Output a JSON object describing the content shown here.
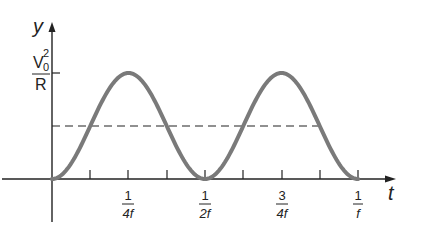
{
  "figure": {
    "y_axis_label": "y",
    "x_axis_label": "t",
    "y_tick": {
      "numerator_base": "V",
      "numerator_sub": "0",
      "numerator_sup": "2",
      "denominator": "R"
    },
    "x_ticks": [
      {
        "num": "1",
        "den": "4f"
      },
      {
        "num": "1",
        "den": "2f"
      },
      {
        "num": "3",
        "den": "4f"
      },
      {
        "num": "1",
        "den": "f"
      }
    ],
    "colors": {
      "curve": "#7a7a7a",
      "axis": "#222222",
      "dashed": "#222222"
    }
  },
  "chart_data": {
    "type": "line",
    "title": "",
    "xlabel": "t",
    "ylabel": "y",
    "series": [
      {
        "name": "instantaneous power",
        "function": "(V0^2/R) * sin^2(2*pi*f*t)",
        "x": [
          0,
          0.125,
          0.25,
          0.375,
          0.5,
          0.625,
          0.75,
          0.875,
          1.0
        ],
        "x_units": "1/f",
        "values": [
          0,
          0.5,
          1,
          0.5,
          0,
          0.5,
          1,
          0.5,
          0
        ],
        "y_units": "V0^2/R"
      },
      {
        "name": "average power",
        "style": "dashed",
        "x": [
          0,
          0.875
        ],
        "values": [
          0.5,
          0.5
        ]
      }
    ],
    "xlim": [
      0,
      1.0
    ],
    "ylim": [
      0,
      1.0
    ],
    "x_tick_labels": [
      "1/4f",
      "1/2f",
      "3/4f",
      "1/f"
    ],
    "y_tick_labels": [
      "V0^2/R"
    ],
    "grid": false
  }
}
